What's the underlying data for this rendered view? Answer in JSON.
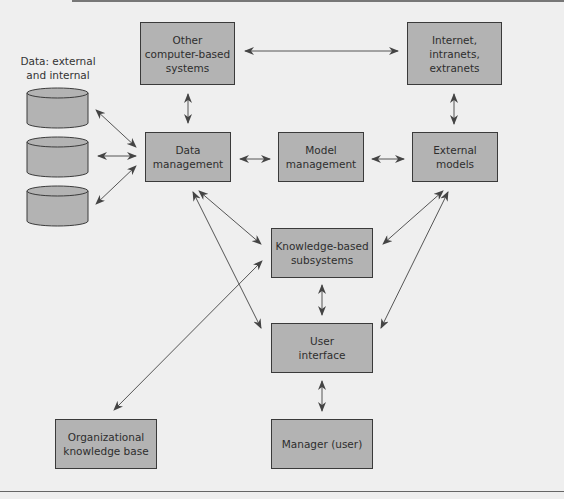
{
  "diagram": {
    "caption": "Data: external\nand internal",
    "nodes": {
      "other_systems": "Other\ncomputer-based\nsystems",
      "internet": "Internet,\nintranets,\nextranets",
      "data_management": "Data\nmanagement",
      "model_management": "Model\nmanagement",
      "external_models": "External\nmodels",
      "knowledge_subsystems": "Knowledge-based\nsubsystems",
      "user_interface": "User\ninterface",
      "manager": "Manager (user)",
      "org_knowledge_base": "Organizational\nknowledge base"
    },
    "data_stores": [
      "database-1",
      "database-2",
      "database-3"
    ],
    "edges": [
      [
        "other_systems",
        "internet"
      ],
      [
        "other_systems",
        "data_management"
      ],
      [
        "internet",
        "external_models"
      ],
      [
        "database-1",
        "data_management"
      ],
      [
        "database-2",
        "data_management"
      ],
      [
        "database-3",
        "data_management"
      ],
      [
        "data_management",
        "model_management"
      ],
      [
        "model_management",
        "external_models"
      ],
      [
        "data_management",
        "knowledge_subsystems"
      ],
      [
        "data_management",
        "user_interface"
      ],
      [
        "external_models",
        "knowledge_subsystems"
      ],
      [
        "external_models",
        "user_interface"
      ],
      [
        "knowledge_subsystems",
        "user_interface"
      ],
      [
        "user_interface",
        "manager"
      ],
      [
        "knowledge_subsystems",
        "org_knowledge_base"
      ]
    ],
    "colors": {
      "box_fill": "#b3b3b3",
      "box_border": "#3a3a3a",
      "background": "#efefef",
      "arrow": "#444444"
    }
  }
}
